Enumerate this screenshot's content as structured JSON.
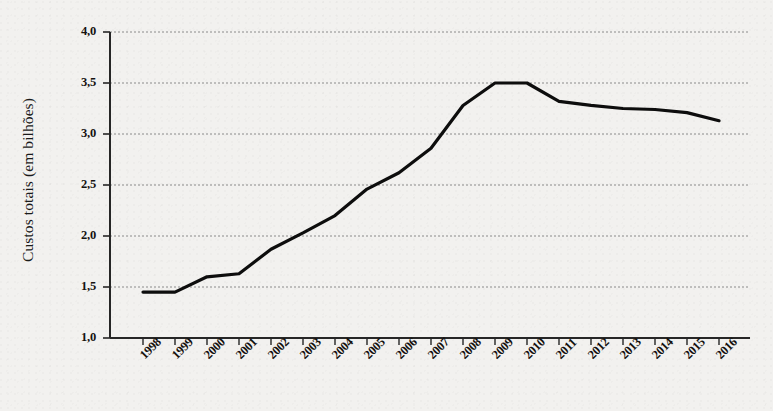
{
  "chart_data": {
    "type": "line",
    "title": "",
    "subtitle": "",
    "xlabel": "",
    "ylabel": "Custos totais (em bilhões)",
    "categories": [
      "1998",
      "1999",
      "2000",
      "2001",
      "2002",
      "2003",
      "2004",
      "2005",
      "2006",
      "2007",
      "2008",
      "2009",
      "2010",
      "2011",
      "2012",
      "2013",
      "2014",
      "2015",
      "2016"
    ],
    "values": [
      1.45,
      1.45,
      1.6,
      1.63,
      1.87,
      2.03,
      2.2,
      2.46,
      2.62,
      2.86,
      3.28,
      3.5,
      3.5,
      3.32,
      3.28,
      3.25,
      3.24,
      3.21,
      3.13
    ],
    "series": [
      {
        "name": "Custos totais",
        "color": "#0d0d0d",
        "values": [
          1.45,
          1.45,
          1.6,
          1.63,
          1.87,
          2.03,
          2.2,
          2.46,
          2.62,
          2.86,
          3.28,
          3.5,
          3.5,
          3.32,
          3.28,
          3.25,
          3.24,
          3.21,
          3.13
        ]
      }
    ],
    "ylim": [
      1.0,
      4.0
    ],
    "yticks": [
      1.0,
      1.5,
      2.0,
      2.5,
      3.0,
      3.5,
      4.0
    ],
    "ytick_labels": [
      "1,0",
      "1,5",
      "2,0",
      "2,5",
      "3,0",
      "3,5",
      "4,0"
    ],
    "grid": true,
    "grid_style": "dotted",
    "grid_color": "#8a8a8a",
    "legend": "none",
    "legend_position": "none",
    "background_color": "#f2f1ef",
    "axis_color": "#262626",
    "xtick_rotation": -45,
    "annotations": []
  },
  "axis": {
    "y_label": "Custos totais (em bilhões)"
  }
}
